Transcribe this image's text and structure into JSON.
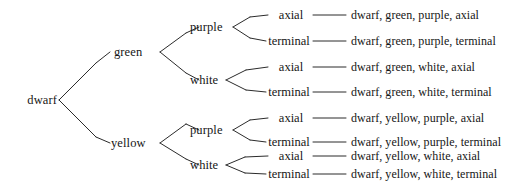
{
  "figure": {
    "kind": "probability-tree-diagram",
    "background_color": "#ffffff",
    "line_color": "#2b2b2b",
    "text_color": "#161616"
  },
  "root": {
    "label": "dwarf"
  },
  "level2": [
    {
      "label": "green"
    },
    {
      "label": "yellow"
    }
  ],
  "level3": [
    {
      "label": "purple"
    },
    {
      "label": "white"
    },
    {
      "label": "purple"
    },
    {
      "label": "white"
    }
  ],
  "leaves": [
    {
      "label": "axial"
    },
    {
      "label": "terminal"
    },
    {
      "label": "axial"
    },
    {
      "label": "terminal"
    },
    {
      "label": "axial"
    },
    {
      "label": "terminal"
    },
    {
      "label": "axial"
    },
    {
      "label": "terminal"
    }
  ],
  "outcomes": [
    {
      "text": "dwarf, green, purple, axial"
    },
    {
      "text": "dwarf, green, purple, terminal"
    },
    {
      "text": "dwarf, green, white, axial"
    },
    {
      "text": "dwarf, green, white, terminal"
    },
    {
      "text": "dwarf, yellow, purple, axial"
    },
    {
      "text": "dwarf, yellow, purple, terminal"
    },
    {
      "text": "dwarf, yellow, white, axial"
    },
    {
      "text": "dwarf, yellow, white, terminal"
    }
  ]
}
